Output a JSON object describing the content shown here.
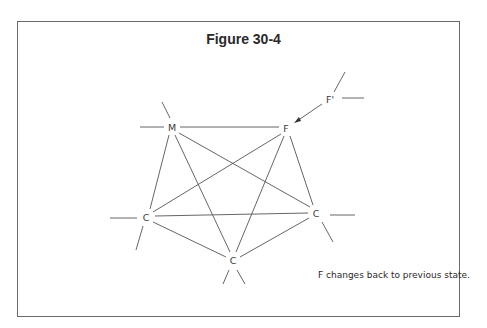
{
  "figure": {
    "title": "Figure 30-4",
    "caption": "F changes back to previous state."
  },
  "nodes": [
    {
      "id": "M",
      "label": "M",
      "x": 172,
      "y": 127
    },
    {
      "id": "F",
      "label": "F",
      "x": 286,
      "y": 128
    },
    {
      "id": "Fp",
      "label": "F'",
      "x": 329,
      "y": 99
    },
    {
      "id": "CL",
      "label": "C",
      "x": 146,
      "y": 217
    },
    {
      "id": "CR",
      "label": "C",
      "x": 316,
      "y": 213
    },
    {
      "id": "CB",
      "label": "C",
      "x": 233,
      "y": 260
    }
  ],
  "edges": [
    [
      "M",
      "F"
    ],
    [
      "M",
      "CL"
    ],
    [
      "M",
      "CB"
    ],
    [
      "M",
      "CR"
    ],
    [
      "F",
      "CL"
    ],
    [
      "F",
      "CB"
    ],
    [
      "F",
      "CR"
    ],
    [
      "CL",
      "CR"
    ],
    [
      "CL",
      "CB"
    ],
    [
      "CR",
      "CB"
    ]
  ],
  "arrow": {
    "from": "Fp",
    "to": "F"
  }
}
